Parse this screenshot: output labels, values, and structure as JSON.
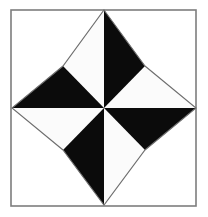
{
  "figure": {
    "kind": "geometric-figure",
    "canvas": {
      "width": 208,
      "height": 217
    },
    "background_color": "#ffffff",
    "frame": {
      "label": "Square border frame",
      "x": 11,
      "y": 10,
      "width": 185,
      "height": 196,
      "stroke_color": "#7d7d7d",
      "stroke_width": 1.6,
      "fill_color": "#ffffff"
    },
    "star": {
      "label": "Concave four-pointed star",
      "points_count": 4,
      "wedges_count": 8,
      "center": {
        "x": 104,
        "y": 108
      },
      "outline_stroke_color": "#6e6e6e",
      "outline_stroke_width": 1.1,
      "white_wedge_color": "#fbfbfb",
      "black_wedge_color": "#0b0b0b",
      "tips": [
        {
          "name": "top-tip",
          "x": 104,
          "y": 10
        },
        {
          "name": "right-tip",
          "x": 196,
          "y": 108
        },
        {
          "name": "bottom-tip",
          "x": 104,
          "y": 205
        },
        {
          "name": "left-tip",
          "x": 12,
          "y": 108
        }
      ],
      "valleys": [
        {
          "name": "upper-left-valley",
          "x": 63,
          "y": 66
        },
        {
          "name": "upper-right-valley",
          "x": 145,
          "y": 66
        },
        {
          "name": "lower-right-valley",
          "x": 145,
          "y": 150
        },
        {
          "name": "lower-left-valley",
          "x": 63,
          "y": 150
        }
      ],
      "wedges": [
        {
          "name": "wedge-top-left-white",
          "shade": "white",
          "a": "top-tip",
          "b": "upper-left-valley"
        },
        {
          "name": "wedge-upper-left-black",
          "shade": "black",
          "a": "upper-left-valley",
          "b": "left-tip"
        },
        {
          "name": "wedge-left-lower-white",
          "shade": "white",
          "a": "left-tip",
          "b": "lower-left-valley"
        },
        {
          "name": "wedge-lower-left-black",
          "shade": "black",
          "a": "lower-left-valley",
          "b": "bottom-tip"
        },
        {
          "name": "wedge-bottom-right-white",
          "shade": "white",
          "a": "bottom-tip",
          "b": "lower-right-valley"
        },
        {
          "name": "wedge-lower-right-black",
          "shade": "black",
          "a": "lower-right-valley",
          "b": "right-tip"
        },
        {
          "name": "wedge-right-upper-white",
          "shade": "white",
          "a": "right-tip",
          "b": "upper-right-valley"
        },
        {
          "name": "wedge-upper-right-black",
          "shade": "black",
          "a": "upper-right-valley",
          "b": "top-tip"
        }
      ]
    }
  }
}
